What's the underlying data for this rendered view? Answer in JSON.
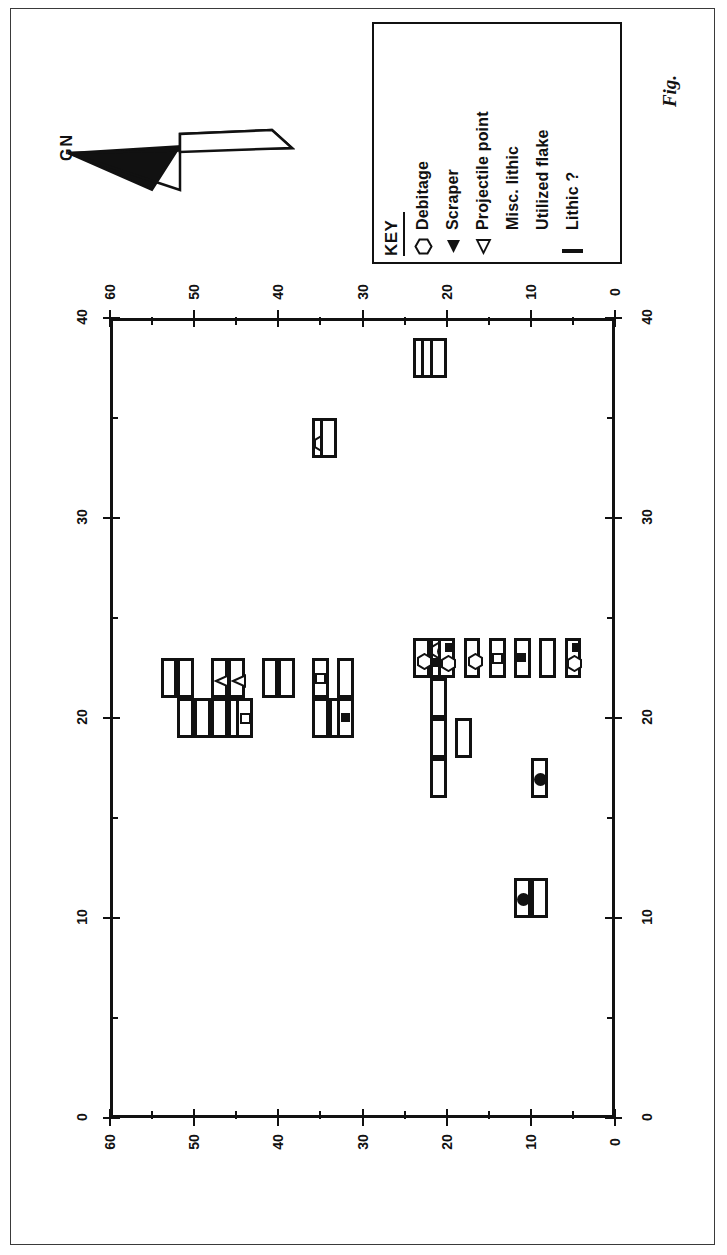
{
  "figure": {
    "caption_label": "Fig.",
    "north_arrow_label": "GN"
  },
  "legend": {
    "title": "KEY",
    "entries": [
      {
        "label": "Debitage",
        "symbol": "hexagon-outline-icon"
      },
      {
        "label": "Scraper",
        "symbol": "triangle-filled-icon"
      },
      {
        "label": "Projectile point",
        "symbol": "triangle-outline-icon"
      },
      {
        "label": "Misc. lithic",
        "symbol": "circle-filled-icon"
      },
      {
        "label": "Utilized flake",
        "symbol": "square-filled-icon"
      },
      {
        "label": "Lithic ?",
        "symbol": "square-outline-icon"
      }
    ]
  },
  "chart_data": {
    "type": "scatter",
    "xlabel": "",
    "ylabel": "",
    "xlim": [
      0,
      60
    ],
    "ylim": [
      0,
      40
    ],
    "grid": false,
    "legend_position": "top-right",
    "orientation": "rotated-90",
    "axes": {
      "horizontal_major_ticks": [
        0,
        10,
        20,
        30,
        40,
        50,
        60
      ],
      "horizontal_tick_labels": [
        "0",
        "10",
        "20",
        "30",
        "40",
        "50",
        "60"
      ],
      "horizontal_minor_step": 5,
      "vertical_major_ticks": [
        0,
        10,
        20,
        30,
        40
      ],
      "vertical_tick_labels": [
        "0",
        "10",
        "20",
        "30",
        "40"
      ],
      "vertical_minor_step": 5,
      "top_axis_labels": [
        "60",
        "40",
        "30",
        "20",
        "10",
        "0"
      ],
      "bottom_axis_labels": [
        "0",
        "40",
        "30",
        "20",
        "10",
        "0"
      ],
      "left_axis_labels": [
        "0",
        "10",
        "20",
        "30",
        "40",
        "50"
      ],
      "right_axis_labels": [
        "10",
        "20",
        "30",
        "40",
        "50"
      ]
    },
    "units": [
      {
        "x": 22,
        "y": 52,
        "artifacts": []
      },
      {
        "x": 22,
        "y": 50,
        "artifacts": []
      },
      {
        "x": 22,
        "y": 46,
        "artifacts": [
          "projectile-point"
        ]
      },
      {
        "x": 22,
        "y": 44,
        "artifacts": [
          "projectile-point"
        ]
      },
      {
        "x": 22,
        "y": 40,
        "artifacts": []
      },
      {
        "x": 22,
        "y": 38,
        "artifacts": []
      },
      {
        "x": 22,
        "y": 34,
        "artifacts": [
          "lithic-question"
        ]
      },
      {
        "x": 22,
        "y": 31,
        "artifacts": []
      },
      {
        "x": 20,
        "y": 50,
        "artifacts": []
      },
      {
        "x": 20,
        "y": 48,
        "artifacts": []
      },
      {
        "x": 20,
        "y": 46,
        "artifacts": []
      },
      {
        "x": 20,
        "y": 44,
        "artifacts": []
      },
      {
        "x": 20,
        "y": 43,
        "artifacts": [
          "lithic-question"
        ]
      },
      {
        "x": 20,
        "y": 34,
        "artifacts": []
      },
      {
        "x": 20,
        "y": 32,
        "artifacts": []
      },
      {
        "x": 20,
        "y": 31,
        "artifacts": [
          "utilized-flake"
        ]
      },
      {
        "x": 34,
        "y": 34,
        "artifacts": [
          "debitage",
          "scraper"
        ]
      },
      {
        "x": 34,
        "y": 33,
        "artifacts": []
      },
      {
        "x": 38,
        "y": 22,
        "artifacts": []
      },
      {
        "x": 38,
        "y": 21,
        "artifacts": []
      },
      {
        "x": 38,
        "y": 20,
        "artifacts": []
      },
      {
        "x": 23,
        "y": 22,
        "artifacts": [
          "debitage"
        ]
      },
      {
        "x": 23,
        "y": 20,
        "artifacts": [
          "utilized-flake",
          "debitage",
          "misc-lithic"
        ]
      },
      {
        "x": 23,
        "y": 19,
        "artifacts": [
          "debitage",
          "utilized-flake"
        ]
      },
      {
        "x": 23,
        "y": 16,
        "artifacts": [
          "debitage"
        ]
      },
      {
        "x": 23,
        "y": 13,
        "artifacts": [
          "lithic-question"
        ]
      },
      {
        "x": 23,
        "y": 10,
        "artifacts": [
          "utilized-flake"
        ]
      },
      {
        "x": 23,
        "y": 7,
        "artifacts": []
      },
      {
        "x": 23,
        "y": 4,
        "artifacts": [
          "debitage",
          "utilized-flake"
        ]
      },
      {
        "x": 21,
        "y": 20,
        "artifacts": []
      },
      {
        "x": 19,
        "y": 20,
        "artifacts": []
      },
      {
        "x": 17,
        "y": 20,
        "artifacts": []
      },
      {
        "x": 19,
        "y": 17,
        "artifacts": []
      },
      {
        "x": 17,
        "y": 8,
        "artifacts": [
          "misc-lithic"
        ]
      },
      {
        "x": 11,
        "y": 10,
        "artifacts": [
          "misc-lithic"
        ]
      },
      {
        "x": 11,
        "y": 8,
        "artifacts": []
      }
    ],
    "artifact_counts": {
      "debitage": 6,
      "scraper": 1,
      "projectile-point": 2,
      "misc-lithic": 3,
      "utilized-flake": 5,
      "lithic-question": 3
    }
  }
}
